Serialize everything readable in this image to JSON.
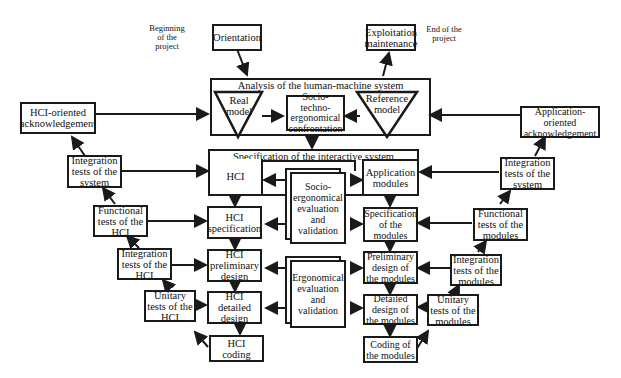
{
  "annotations": {
    "beginning": "Beginning\nof the\nproject",
    "end": "End of the\nproject"
  },
  "top": {
    "orientation": "Orientation",
    "exploitation": "Exploitation\nmaintenance"
  },
  "analysis": {
    "title": "Analysis of the human-machine system",
    "real_model": "Real\nmodel",
    "confrontation": "Socio-techno-\nergonomical\nconfrontation",
    "reference_model": "Reference\nmodel"
  },
  "acknowledgement": {
    "hci": "HCI-oriented\nacknowledgement",
    "application": "Application-oriented\nacknowledgement"
  },
  "specification": {
    "title": "Specification of the interactive system",
    "hci": "HCI",
    "application": "Application\nmodules"
  },
  "evaluation": {
    "socio": "Socio-\nergonomical\nevaluation\nand\nvalidation",
    "ergo": "Ergonomical\nevaluation\nand\nvalidation"
  },
  "hci_branch": {
    "specification": "HCI\nspecification",
    "preliminary": "HCI\npreliminary\ndesign",
    "detailed": "HCI\ndetailed\ndesign",
    "coding": "HCI\ncoding"
  },
  "modules_branch": {
    "specification": "Specification\nof the\nmodules",
    "preliminary": "Preliminary\ndesign of\nthe modules",
    "detailed": "Detailed\ndesign of\nthe modules",
    "coding": "Coding of\nthe modules"
  },
  "left_tests": {
    "integration_system": "Integration\ntests of the\nsystem",
    "functional_hci": "Functional\ntests of the\nHCI",
    "integration_hci": "Integration\ntests of the\nHCI",
    "unitary_hci": "Unitary\ntests of the\nHCI"
  },
  "right_tests": {
    "integration_system": "Integration\ntests of the\nsystem",
    "functional_modules": "Functional\ntests of the\nmodules",
    "integration_modules": "Integration\ntests of the\nmodules",
    "unitary_modules": "Unitary\ntests of the\nmodules"
  }
}
